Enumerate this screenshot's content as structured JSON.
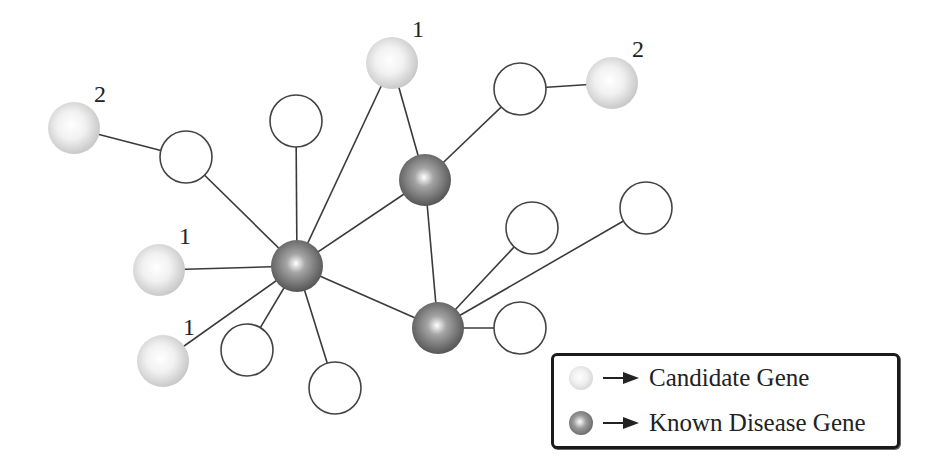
{
  "diagram": {
    "colors": {
      "edge": "#3a3a3a",
      "candidate_fill_center": "#ffffff",
      "candidate_fill_edge": "#c4c4c4",
      "disease_fill_center": "#ffffff",
      "disease_fill_edge": "#4a4a4a",
      "empty_stroke": "#444444"
    },
    "nodes": [
      {
        "id": "c_tl",
        "type": "candidate",
        "x": 74,
        "y": 128,
        "label": "2"
      },
      {
        "id": "e1",
        "type": "empty",
        "x": 186,
        "y": 157
      },
      {
        "id": "e2",
        "type": "empty",
        "x": 296,
        "y": 121
      },
      {
        "id": "c_top",
        "type": "candidate",
        "x": 392,
        "y": 63,
        "label": "1"
      },
      {
        "id": "d_top",
        "type": "disease",
        "x": 425,
        "y": 180
      },
      {
        "id": "e3",
        "type": "empty",
        "x": 520,
        "y": 89
      },
      {
        "id": "c_tr",
        "type": "candidate",
        "x": 612,
        "y": 83,
        "label": "2"
      },
      {
        "id": "d_hub",
        "type": "disease",
        "x": 297,
        "y": 266
      },
      {
        "id": "c_l1",
        "type": "candidate",
        "x": 159,
        "y": 270,
        "label": "1"
      },
      {
        "id": "c_l2",
        "type": "candidate",
        "x": 163,
        "y": 361,
        "label": "1"
      },
      {
        "id": "e4",
        "type": "empty",
        "x": 247,
        "y": 350
      },
      {
        "id": "e5",
        "type": "empty",
        "x": 335,
        "y": 388
      },
      {
        "id": "d_low",
        "type": "disease",
        "x": 438,
        "y": 328
      },
      {
        "id": "e6",
        "type": "empty",
        "x": 532,
        "y": 228
      },
      {
        "id": "e7",
        "type": "empty",
        "x": 646,
        "y": 208
      },
      {
        "id": "e8",
        "type": "empty",
        "x": 520,
        "y": 328
      }
    ],
    "edges": [
      [
        "c_tl",
        "e1"
      ],
      [
        "e1",
        "d_hub"
      ],
      [
        "e2",
        "d_hub"
      ],
      [
        "c_top",
        "d_hub"
      ],
      [
        "c_top",
        "d_top"
      ],
      [
        "d_top",
        "d_hub"
      ],
      [
        "d_top",
        "e3"
      ],
      [
        "e3",
        "c_tr"
      ],
      [
        "d_top",
        "d_low"
      ],
      [
        "c_l1",
        "d_hub"
      ],
      [
        "c_l2",
        "d_hub"
      ],
      [
        "e4",
        "d_hub"
      ],
      [
        "e5",
        "d_hub"
      ],
      [
        "d_hub",
        "d_low"
      ],
      [
        "d_low",
        "e6"
      ],
      [
        "d_low",
        "e7"
      ],
      [
        "d_low",
        "e8"
      ]
    ]
  },
  "legend": {
    "items": [
      {
        "icon": "candidate-gene-icon",
        "label": "Candidate Gene"
      },
      {
        "icon": "known-disease-gene-icon",
        "label": "Known Disease Gene"
      }
    ]
  }
}
